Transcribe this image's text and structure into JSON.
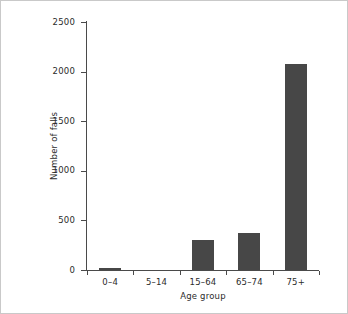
{
  "chart_data": {
    "type": "bar",
    "title": "",
    "subtitle": "",
    "xlabel": "Age group",
    "ylabel": "Number of falls",
    "categories": [
      "0–4",
      "5–14",
      "15–64",
      "65–74",
      "75+"
    ],
    "values": [
      25,
      0,
      300,
      375,
      2080
    ],
    "series": [
      {
        "name": "Number of falls",
        "values": [
          25,
          0,
          300,
          375,
          2080
        ]
      }
    ],
    "ylim": [
      0,
      2500
    ],
    "ytick_labels": [
      "0",
      "500",
      "1000",
      "1500",
      "2000",
      "2500"
    ],
    "ytick_values": [
      0,
      500,
      1000,
      1500,
      2000,
      2500
    ],
    "grid": false,
    "legend": false,
    "legend_position": "none",
    "bar_color": "#474747",
    "axis_color": "#4a4a4a",
    "text_color": "#2b2b2b",
    "background_color": "#ffffff",
    "border_color": "#c9c9c9",
    "annotations": []
  }
}
